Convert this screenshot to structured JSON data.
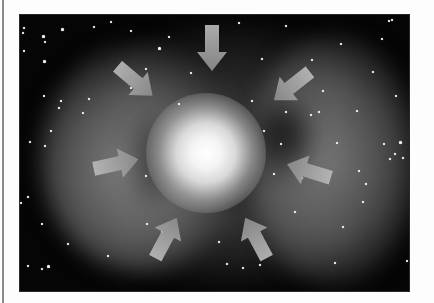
{
  "figure": {
    "background_color": "#050505",
    "page_color": "#fdfdfd",
    "rule_color": "#8a8a8a",
    "arrow_color_light": "#b9b9b9",
    "arrow_color_dark": "#8c8c8c",
    "core_color": "#ffffff",
    "arrows": [
      {
        "name": "arrow-top",
        "direction": "down",
        "cx": 192,
        "cy": 33,
        "angle": 90
      },
      {
        "name": "arrow-upper-left",
        "direction": "down-right",
        "cx": 115,
        "cy": 66,
        "angle": 40
      },
      {
        "name": "arrow-upper-right",
        "direction": "down-left",
        "cx": 272,
        "cy": 71,
        "angle": 142
      },
      {
        "name": "arrow-left",
        "direction": "right",
        "cx": 96,
        "cy": 149,
        "angle": -12
      },
      {
        "name": "arrow-right",
        "direction": "left",
        "cx": 289,
        "cy": 156,
        "angle": 197
      },
      {
        "name": "arrow-lower-left",
        "direction": "up-right",
        "cx": 146,
        "cy": 223,
        "angle": -62
      },
      {
        "name": "arrow-lower-right",
        "direction": "up-left",
        "cx": 236,
        "cy": 223,
        "angle": -118
      }
    ],
    "stars": [
      [
        3,
        12
      ],
      [
        2,
        17
      ],
      [
        24,
        26
      ],
      [
        3,
        35
      ],
      [
        73,
        11
      ],
      [
        90,
        6
      ],
      [
        110,
        15
      ],
      [
        148,
        21
      ],
      [
        68,
        83
      ],
      [
        62,
        97
      ],
      [
        40,
        85
      ],
      [
        38,
        92
      ],
      [
        23,
        80
      ],
      [
        30,
        115
      ],
      [
        24,
        130
      ],
      [
        9,
        126
      ],
      [
        0,
        187
      ],
      [
        7,
        181
      ],
      [
        21,
        208
      ],
      [
        7,
        250
      ],
      [
        21,
        253
      ],
      [
        87,
        240
      ],
      [
        47,
        228
      ],
      [
        125,
        160
      ],
      [
        110,
        72
      ],
      [
        125,
        53
      ],
      [
        126,
        208
      ],
      [
        158,
        88
      ],
      [
        170,
        57
      ],
      [
        218,
        7
      ],
      [
        241,
        43
      ],
      [
        265,
        10
      ],
      [
        291,
        44
      ],
      [
        320,
        28
      ],
      [
        352,
        56
      ],
      [
        361,
        23
      ],
      [
        368,
        5
      ],
      [
        371,
        4
      ],
      [
        391,
        26
      ],
      [
        375,
        80
      ],
      [
        336,
        95
      ],
      [
        363,
        128
      ],
      [
        374,
        138
      ],
      [
        382,
        142
      ],
      [
        369,
        143
      ],
      [
        345,
        168
      ],
      [
        342,
        186
      ],
      [
        322,
        211
      ],
      [
        391,
        197
      ],
      [
        386,
        245
      ],
      [
        314,
        247
      ],
      [
        239,
        249
      ],
      [
        222,
        252
      ],
      [
        206,
        248
      ],
      [
        198,
        226
      ],
      [
        141,
        216
      ],
      [
        243,
        115
      ],
      [
        260,
        128
      ],
      [
        253,
        158
      ],
      [
        281,
        162
      ],
      [
        274,
        196
      ],
      [
        231,
        85
      ],
      [
        265,
        96
      ],
      [
        298,
        96
      ],
      [
        316,
        127
      ],
      [
        338,
        155
      ],
      [
        290,
        99
      ],
      [
        302,
        75
      ]
    ],
    "big_stars": [
      [
        41,
        13
      ],
      [
        22,
        20
      ],
      [
        138,
        32
      ],
      [
        23,
        45
      ],
      [
        379,
        126
      ],
      [
        27,
        250
      ]
    ]
  }
}
